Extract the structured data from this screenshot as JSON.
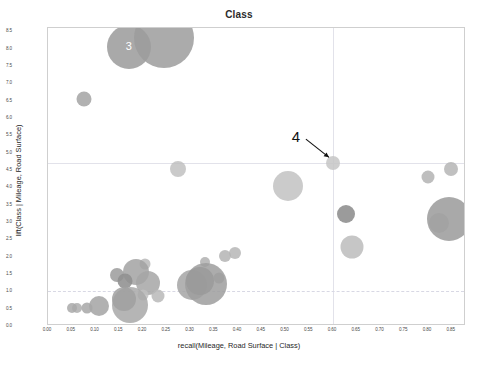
{
  "chart_data": {
    "type": "scatter",
    "title": "Class",
    "xlabel": "recall(Mileage, Road Surface | Class)",
    "ylabel": "lift(Class | Mileage, Road Surface)",
    "xlim": [
      0.0,
      0.88
    ],
    "ylim": [
      0.0,
      8.6
    ],
    "grid": true,
    "legend": "none",
    "xticks": [
      "0.00",
      "0.05",
      "0.10",
      "0.15",
      "0.20",
      "0.25",
      "0.30",
      "0.35",
      "0.40",
      "0.45",
      "0.50",
      "0.55",
      "0.60",
      "0.65",
      "0.70",
      "0.75",
      "0.80",
      "0.85"
    ],
    "xtick_values": [
      0.0,
      0.05,
      0.1,
      0.15,
      0.2,
      0.25,
      0.3,
      0.35,
      0.4,
      0.45,
      0.5,
      0.55,
      0.6,
      0.65,
      0.7,
      0.75,
      0.8,
      0.85
    ],
    "yticks": [
      "0.0",
      "0.5",
      "1.0",
      "1.5",
      "2.0",
      "2.5",
      "3.0",
      "3.5",
      "4.0",
      "4.5",
      "5.0",
      "5.5",
      "6.0",
      "6.5",
      "7.0",
      "7.5",
      "8.0",
      "8.5"
    ],
    "ytick_values": [
      0.0,
      0.5,
      1.0,
      1.5,
      2.0,
      2.5,
      3.0,
      3.5,
      4.0,
      4.5,
      5.0,
      5.5,
      6.0,
      6.5,
      7.0,
      7.5,
      8.0,
      8.5
    ],
    "gridlines": {
      "vertical": [
        0.6
      ],
      "horizontal": [
        4.7
      ],
      "dashed_horizontal": [
        1.0
      ]
    },
    "bubble_color": "#a0a0a0",
    "points": [
      {
        "x": 0.075,
        "y": 6.55,
        "r": 7.5,
        "c": "#9d9d9d",
        "o": 0.8
      },
      {
        "x": 0.17,
        "y": 8.05,
        "r": 22.0,
        "c": "#9a9a9a",
        "o": 0.85
      },
      {
        "x": 0.245,
        "y": 8.3,
        "r": 30.0,
        "c": "#9c9c9c",
        "o": 0.85
      },
      {
        "x": 0.273,
        "y": 4.52,
        "r": 8.0,
        "c": "#bdbdbd",
        "o": 0.8
      },
      {
        "x": 0.505,
        "y": 4.05,
        "r": 15.0,
        "c": "#c2c2c2",
        "o": 0.85
      },
      {
        "x": 0.6,
        "y": 4.7,
        "r": 7.0,
        "c": "#c6c6c6",
        "o": 0.85
      },
      {
        "x": 0.628,
        "y": 3.22,
        "r": 9.0,
        "c": "#8d8d8d",
        "o": 0.88
      },
      {
        "x": 0.64,
        "y": 2.27,
        "r": 11.5,
        "c": "#bcbcbc",
        "o": 0.85
      },
      {
        "x": 0.8,
        "y": 4.3,
        "r": 6.5,
        "c": "#b3b3b3",
        "o": 0.85
      },
      {
        "x": 0.848,
        "y": 4.52,
        "r": 7.0,
        "c": "#b5b5b5",
        "o": 0.85
      },
      {
        "x": 0.824,
        "y": 2.98,
        "r": 10.0,
        "c": "#cbcbcb",
        "o": 0.85
      },
      {
        "x": 0.845,
        "y": 3.08,
        "r": 22.0,
        "c": "#9a9a9a",
        "o": 0.85
      },
      {
        "x": 0.393,
        "y": 2.12,
        "r": 6.0,
        "c": "#b6b6b6",
        "o": 0.85
      },
      {
        "x": 0.372,
        "y": 2.02,
        "r": 6.0,
        "c": "#b4b4b4",
        "o": 0.85
      },
      {
        "x": 0.33,
        "y": 1.85,
        "r": 5.0,
        "c": "#b0b0b0",
        "o": 0.85
      },
      {
        "x": 0.36,
        "y": 1.38,
        "r": 5.5,
        "c": "#aaaaaa",
        "o": 0.85
      },
      {
        "x": 0.205,
        "y": 1.78,
        "r": 5.5,
        "c": "#b8b8b8",
        "o": 0.85
      },
      {
        "x": 0.185,
        "y": 1.55,
        "r": 13.0,
        "c": "#a2a2a2",
        "o": 0.85
      },
      {
        "x": 0.145,
        "y": 1.48,
        "r": 7.0,
        "c": "#9b9b9b",
        "o": 0.85
      },
      {
        "x": 0.163,
        "y": 1.3,
        "r": 7.5,
        "c": "#8f8f8f",
        "o": 0.88
      },
      {
        "x": 0.21,
        "y": 1.25,
        "r": 12.0,
        "c": "#a6a6a6",
        "o": 0.85
      },
      {
        "x": 0.303,
        "y": 1.18,
        "r": 15.0,
        "c": "#a4a4a4",
        "o": 0.85
      },
      {
        "x": 0.332,
        "y": 1.22,
        "r": 21.0,
        "c": "#9d9d9d",
        "o": 0.85
      },
      {
        "x": 0.32,
        "y": 1.3,
        "r": 14.0,
        "c": "#9a9a9a",
        "o": 0.85
      },
      {
        "x": 0.2,
        "y": 0.9,
        "r": 5.5,
        "c": "#c0c0c0",
        "o": 0.85
      },
      {
        "x": 0.232,
        "y": 0.88,
        "r": 6.5,
        "c": "#b9b9b9",
        "o": 0.85
      },
      {
        "x": 0.172,
        "y": 0.62,
        "r": 18.0,
        "c": "#a8a8a8",
        "o": 0.85
      },
      {
        "x": 0.16,
        "y": 0.78,
        "r": 12.0,
        "c": "#a0a0a0",
        "o": 0.85
      },
      {
        "x": 0.108,
        "y": 0.58,
        "r": 10.0,
        "c": "#a3a3a3",
        "o": 0.85
      },
      {
        "x": 0.062,
        "y": 0.52,
        "r": 5.0,
        "c": "#aeaeae",
        "o": 0.85
      },
      {
        "x": 0.05,
        "y": 0.52,
        "r": 5.0,
        "c": "#a9a9a9",
        "o": 0.85
      },
      {
        "x": 0.083,
        "y": 0.52,
        "r": 5.5,
        "c": "#a7a7a7",
        "o": 0.85
      }
    ],
    "annotations": [
      {
        "label": "3",
        "x": 0.172,
        "y": 8.05,
        "style": "inline-white"
      },
      {
        "label": "4",
        "x": 0.524,
        "y": 5.45,
        "style": "arrow",
        "target_x": 0.6,
        "target_y": 4.78
      }
    ]
  }
}
